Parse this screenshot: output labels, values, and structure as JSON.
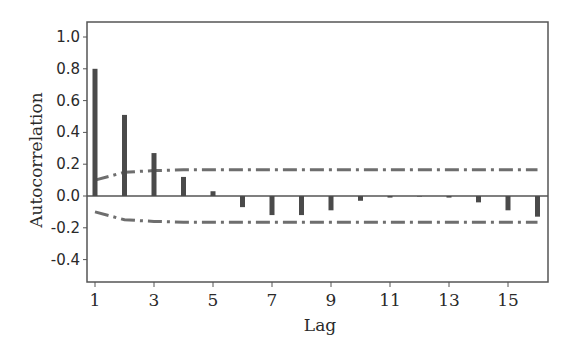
{
  "chart_data": {
    "type": "bar",
    "title": "",
    "xlabel": "Lag",
    "ylabel": "Autocorrelation",
    "x": [
      1,
      2,
      3,
      4,
      5,
      6,
      7,
      8,
      9,
      10,
      11,
      12,
      13,
      14,
      15,
      16
    ],
    "series": [
      {
        "name": "ACF",
        "values": [
          0.8,
          0.51,
          0.27,
          0.12,
          0.03,
          -0.07,
          -0.12,
          -0.12,
          -0.09,
          -0.03,
          -0.01,
          0.0,
          -0.01,
          -0.04,
          -0.09,
          -0.13
        ]
      },
      {
        "name": "Upper confidence limit",
        "style": "dash-dot",
        "values": [
          0.1,
          0.15,
          0.16,
          0.165,
          0.165,
          0.165,
          0.165,
          0.165,
          0.165,
          0.165,
          0.165,
          0.165,
          0.165,
          0.165,
          0.165,
          0.165
        ]
      },
      {
        "name": "Lower confidence limit",
        "style": "dash-dot",
        "values": [
          -0.1,
          -0.15,
          -0.16,
          -0.165,
          -0.165,
          -0.165,
          -0.165,
          -0.165,
          -0.165,
          -0.165,
          -0.165,
          -0.165,
          -0.165,
          -0.165,
          -0.165,
          -0.165
        ]
      }
    ],
    "ylim": [
      -0.54,
      1.09
    ],
    "xlim": [
      0.6,
      16.4
    ],
    "yticks": [
      1.0,
      0.8,
      0.6,
      0.4,
      0.2,
      0.0,
      -0.2,
      -0.4
    ],
    "ytick_labels": [
      "1.0",
      "0.8",
      "0.6",
      "0.4",
      "0.2",
      "0.0",
      "-0.2",
      "-0.4"
    ],
    "xticks": [
      1,
      3,
      5,
      7,
      9,
      11,
      13,
      15
    ],
    "xtick_labels": [
      "1",
      "3",
      "5",
      "7",
      "9",
      "11",
      "13",
      "15"
    ],
    "grid": false,
    "legend": "none",
    "colors": {
      "bars": "#4a4a4a",
      "limits": "#6e6e6e",
      "axes": "#555555"
    }
  },
  "labels": {
    "xlabel": "Lag",
    "ylabel": "Autocorrelation"
  }
}
